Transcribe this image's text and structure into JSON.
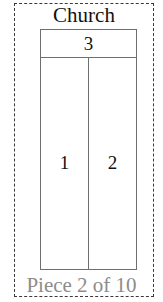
{
  "plan": {
    "title": "Church",
    "rooms": [
      {
        "number": "1",
        "position": "lower-left"
      },
      {
        "number": "2",
        "position": "lower-right"
      },
      {
        "number": "3",
        "position": "top-band"
      }
    ]
  },
  "caption": {
    "text": "Piece 2 of 10",
    "index": 2,
    "total": 10
  },
  "colors": {
    "selection_border": "#3a3a3a",
    "plan_line": "#6f6f6f",
    "title_text": "#111111",
    "caption_text": "#8c8c8c",
    "background": "#ffffff"
  }
}
